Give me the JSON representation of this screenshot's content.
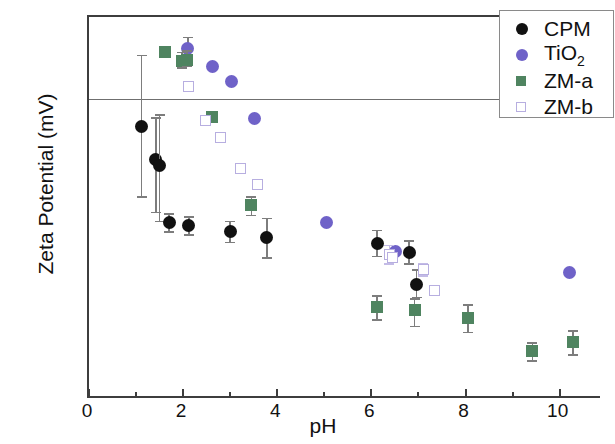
{
  "chart_data": {
    "type": "scatter",
    "title": "",
    "xlabel": "pH",
    "ylabel": "Zeta Potential (mV)",
    "xlim": [
      0,
      10.9
    ],
    "ylim": [
      -100,
      26
    ],
    "xticks": [
      0,
      2,
      4,
      6,
      8,
      10
    ],
    "yticks": [
      20,
      0,
      -20,
      -40,
      -60,
      -80,
      -100
    ],
    "x_minor_step": 1,
    "y_minor_step": 10,
    "grid": false,
    "legend_position": "top-right",
    "zero_reference_line": 0,
    "series": [
      {
        "name": "CPM",
        "marker": "filled-circle",
        "color": "#111111",
        "points": [
          {
            "x": 1.12,
            "y": -10.0,
            "yerr_lo": 23.0,
            "yerr_hi": 23.5
          },
          {
            "x": 1.42,
            "y": -21.0,
            "yerr_lo": 17.0,
            "yerr_hi": 14.0
          },
          {
            "x": 1.5,
            "y": -23.0,
            "yerr_lo": 18.0,
            "yerr_hi": 17.0
          },
          {
            "x": 1.7,
            "y": -41.5,
            "yerr_lo": 3.0,
            "yerr_hi": 3.0
          },
          {
            "x": 2.12,
            "y": -42.5,
            "yerr_lo": 3.0,
            "yerr_hi": 3.0
          },
          {
            "x": 3.0,
            "y": -44.5,
            "yerr_lo": 3.5,
            "yerr_hi": 3.5
          },
          {
            "x": 3.78,
            "y": -46.5,
            "yerr_lo": 6.5,
            "yerr_hi": 6.5
          },
          {
            "x": 6.12,
            "y": -48.5,
            "yerr_lo": 4.0,
            "yerr_hi": 4.5
          },
          {
            "x": 6.8,
            "y": -51.5,
            "yerr_lo": 3.5,
            "yerr_hi": 4.0
          },
          {
            "x": 6.96,
            "y": -62.0,
            "yerr_lo": 4.0,
            "yerr_hi": 5.0
          }
        ]
      },
      {
        "name": "TiO2",
        "marker": "filled-circle",
        "color": "#6f62c8",
        "points": [
          {
            "x": 2.1,
            "y": 15.5,
            "yerr_lo": 3.5,
            "yerr_hi": 4.0
          },
          {
            "x": 2.62,
            "y": 9.8,
            "yerr_lo": 0,
            "yerr_hi": 0
          },
          {
            "x": 3.02,
            "y": 4.8,
            "yerr_lo": 0,
            "yerr_hi": 0
          },
          {
            "x": 3.52,
            "y": -7.5,
            "yerr_lo": 0,
            "yerr_hi": 0
          },
          {
            "x": 5.05,
            "y": -41.5,
            "yerr_lo": 0,
            "yerr_hi": 0
          },
          {
            "x": 6.52,
            "y": -51.0,
            "yerr_lo": 0,
            "yerr_hi": 0
          },
          {
            "x": 10.2,
            "y": -58.0,
            "yerr_lo": 0,
            "yerr_hi": 0
          }
        ]
      },
      {
        "name": "ZM-a",
        "marker": "filled-square",
        "color": "#4f8460",
        "points": [
          {
            "x": 1.62,
            "y": 14.5,
            "yerr_lo": 0,
            "yerr_hi": 0
          },
          {
            "x": 1.98,
            "y": 11.5,
            "yerr_lo": 2.0,
            "yerr_hi": 3.0
          },
          {
            "x": 2.08,
            "y": 12.0,
            "yerr_lo": 2.0,
            "yerr_hi": 3.0
          },
          {
            "x": 2.62,
            "y": -7.0,
            "yerr_lo": 0,
            "yerr_hi": 0
          },
          {
            "x": 3.45,
            "y": -36.0,
            "yerr_lo": 3.0,
            "yerr_hi": 3.0
          },
          {
            "x": 6.12,
            "y": -69.5,
            "yerr_lo": 4.0,
            "yerr_hi": 4.0
          },
          {
            "x": 6.92,
            "y": -70.5,
            "yerr_lo": 5.0,
            "yerr_hi": 4.0
          },
          {
            "x": 8.05,
            "y": -73.0,
            "yerr_lo": 4.5,
            "yerr_hi": 4.5
          },
          {
            "x": 9.42,
            "y": -84.0,
            "yerr_lo": 3.0,
            "yerr_hi": 3.0
          },
          {
            "x": 10.28,
            "y": -81.0,
            "yerr_lo": 4.0,
            "yerr_hi": 4.0
          }
        ]
      },
      {
        "name": "ZM-b",
        "marker": "open-square",
        "color": "#b7aee0",
        "points": [
          {
            "x": 2.12,
            "y": 3.0,
            "yerr_lo": 0,
            "yerr_hi": 0
          },
          {
            "x": 2.48,
            "y": -8.0,
            "yerr_lo": 0,
            "yerr_hi": 0
          },
          {
            "x": 2.8,
            "y": -13.5,
            "yerr_lo": 0,
            "yerr_hi": 0
          },
          {
            "x": 3.22,
            "y": -24.0,
            "yerr_lo": 0,
            "yerr_hi": 0
          },
          {
            "x": 3.58,
            "y": -29.0,
            "yerr_lo": 0,
            "yerr_hi": 0
          },
          {
            "x": 6.38,
            "y": -52.0,
            "yerr_lo": 3.0,
            "yerr_hi": 3.0
          },
          {
            "x": 6.45,
            "y": -53.0,
            "yerr_lo": 0,
            "yerr_hi": 0
          },
          {
            "x": 7.1,
            "y": -57.0,
            "yerr_lo": 2.0,
            "yerr_hi": 2.0
          },
          {
            "x": 7.35,
            "y": -64.0,
            "yerr_lo": 0,
            "yerr_hi": 0
          }
        ]
      }
    ]
  },
  "legend": {
    "entries": [
      {
        "label": "CPM",
        "sub": "",
        "marker": "filled-circle",
        "color": "#111111"
      },
      {
        "label": "TiO",
        "sub": "2",
        "marker": "filled-circle",
        "color": "#6f62c8"
      },
      {
        "label": "ZM-a",
        "sub": "",
        "marker": "filled-square",
        "color": "#4f8460"
      },
      {
        "label": "ZM-b",
        "sub": "",
        "marker": "open-square",
        "color": "#b7aee0"
      }
    ]
  },
  "axes": {
    "x_title": "pH",
    "y_title": "Zeta Potential (mV)",
    "x_tick_labels": [
      "0",
      "2",
      "4",
      "6",
      "8",
      "10"
    ],
    "y_tick_labels": [
      "20",
      "0",
      "-20",
      "-40",
      "-60",
      "-80",
      "-100"
    ]
  }
}
